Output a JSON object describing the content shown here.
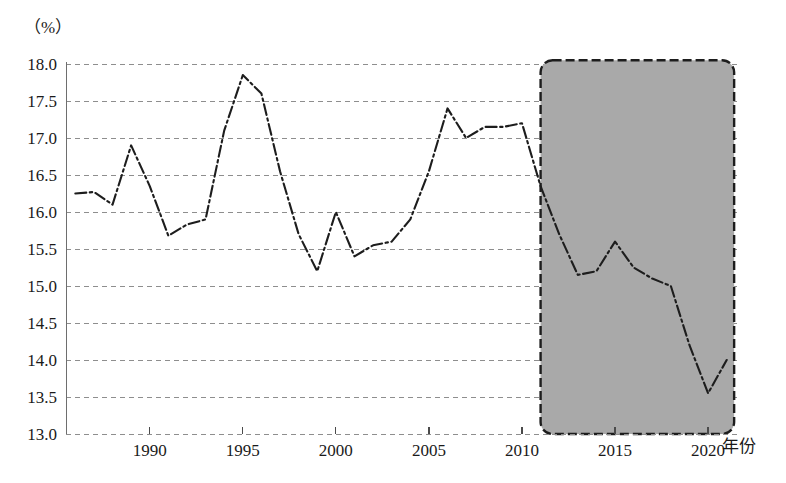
{
  "chart_data": {
    "type": "line",
    "title": "",
    "subtitle": "",
    "xlabel": "年份",
    "ylabel": "",
    "unit_label": "（%）",
    "xlim": [
      1985.5,
      2021.5
    ],
    "ylim": [
      13.0,
      18.0
    ],
    "grid": true,
    "legend": "none",
    "y_ticks": [
      "18.0",
      "17.5",
      "17.0",
      "16.5",
      "16.0",
      "15.5",
      "15.0",
      "14.5",
      "14.0",
      "13.5",
      "13.0"
    ],
    "y_tick_values": [
      18.0,
      17.5,
      17.0,
      16.5,
      16.0,
      15.5,
      15.0,
      14.5,
      14.0,
      13.5,
      13.0
    ],
    "x_ticks": [
      "1990",
      "1995",
      "2000",
      "2005",
      "2010",
      "2015",
      "2020"
    ],
    "x_tick_values": [
      1990,
      1995,
      2000,
      2005,
      2010,
      2015,
      2020
    ],
    "series": [
      {
        "name": "比重",
        "line_style": "dash-dot",
        "color": "#1d1d1d",
        "x": [
          1986,
          1987,
          1988,
          1989,
          1990,
          1991,
          1992,
          1993,
          1994,
          1995,
          1996,
          1997,
          1998,
          1999,
          2000,
          2001,
          2002,
          2003,
          2004,
          2005,
          2006,
          2007,
          2008,
          2009,
          2010,
          2011,
          2012,
          2013,
          2014,
          2015,
          2016,
          2017,
          2018,
          2019,
          2020,
          2021
        ],
        "values": [
          16.25,
          16.27,
          16.1,
          16.9,
          16.35,
          15.68,
          15.83,
          15.9,
          17.1,
          17.85,
          17.6,
          16.55,
          15.7,
          15.2,
          16.0,
          15.4,
          15.55,
          15.6,
          15.9,
          16.55,
          17.4,
          17.0,
          17.15,
          17.15,
          17.2,
          16.35,
          15.7,
          15.15,
          15.2,
          15.6,
          15.25,
          15.1,
          15.0,
          14.2,
          13.55,
          14.0
        ]
      }
    ],
    "annotations": [
      {
        "name": "highlight-region",
        "type": "shaded-rect",
        "x_start": 2011,
        "x_end": 2021.4,
        "y_start": 13.0,
        "y_end": 18.05,
        "fill": "#a9a9a9",
        "border": "#1d1d1d",
        "border_style": "dashed",
        "label": ""
      }
    ]
  }
}
